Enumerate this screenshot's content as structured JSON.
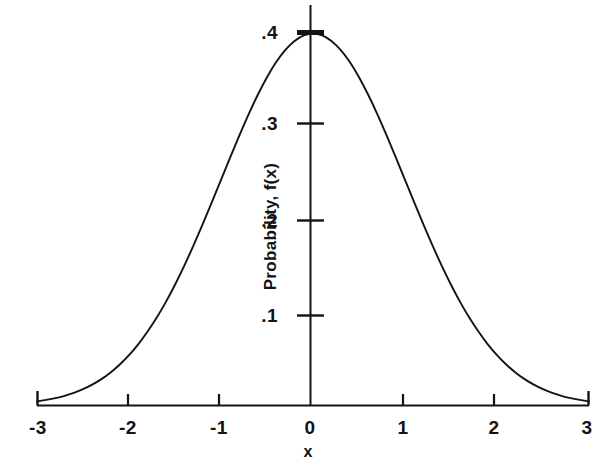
{
  "figure": {
    "background_color": "#ffffff",
    "ink_color": "#131313"
  },
  "chart_data": {
    "type": "line",
    "title": "",
    "subtitle": "",
    "xlabel": "x",
    "ylabel": "Probability, f(x)",
    "xlim": [
      -3,
      3
    ],
    "ylim": [
      0,
      0.4
    ],
    "grid": false,
    "legend": null,
    "annotations": [],
    "x_ticks": [
      -3,
      -2,
      -1,
      0,
      1,
      2,
      3
    ],
    "x_tick_labels": [
      "-3",
      "-2",
      "-1",
      "0",
      "1",
      "2",
      "3"
    ],
    "y_ticks": [
      0.1,
      0.2,
      0.3,
      0.4
    ],
    "y_tick_labels": [
      ".1",
      ".2",
      ".3",
      ".4"
    ],
    "series": [
      {
        "name": "standard normal probability density",
        "x": [
          -3.0,
          -2.9,
          -2.8,
          -2.7,
          -2.6,
          -2.5,
          -2.4,
          -2.3,
          -2.2,
          -2.1,
          -2.0,
          -1.9,
          -1.8,
          -1.7,
          -1.6,
          -1.5,
          -1.4,
          -1.3,
          -1.2,
          -1.1,
          -1.0,
          -0.9,
          -0.8,
          -0.7,
          -0.6,
          -0.5,
          -0.4,
          -0.3,
          -0.2,
          -0.1,
          0.0,
          0.1,
          0.2,
          0.3,
          0.4,
          0.5,
          0.6,
          0.7,
          0.8,
          0.9,
          1.0,
          1.1,
          1.2,
          1.3,
          1.4,
          1.5,
          1.6,
          1.7,
          1.8,
          1.9,
          2.0,
          2.1,
          2.2,
          2.3,
          2.4,
          2.5,
          2.6,
          2.7,
          2.8,
          2.9,
          3.0
        ],
        "values": [
          0.0044,
          0.006,
          0.0079,
          0.0104,
          0.0136,
          0.0175,
          0.0224,
          0.0283,
          0.0355,
          0.044,
          0.054,
          0.0656,
          0.079,
          0.094,
          0.1109,
          0.1295,
          0.1497,
          0.1714,
          0.1942,
          0.2179,
          0.242,
          0.2661,
          0.2897,
          0.3123,
          0.3332,
          0.3521,
          0.3683,
          0.3814,
          0.391,
          0.397,
          0.3989,
          0.397,
          0.391,
          0.3814,
          0.3683,
          0.3521,
          0.3332,
          0.3123,
          0.2897,
          0.2661,
          0.242,
          0.2179,
          0.1942,
          0.1714,
          0.1497,
          0.1295,
          0.1109,
          0.094,
          0.079,
          0.0656,
          0.054,
          0.044,
          0.0355,
          0.0283,
          0.0224,
          0.0175,
          0.0136,
          0.0104,
          0.0079,
          0.006,
          0.0044
        ]
      }
    ]
  },
  "labels": {
    "y_tick_4": ".4",
    "y_tick_3": ".3",
    "y_tick_2": ".2",
    "y_tick_1": ".1",
    "x_tick_m3": "-3",
    "x_tick_m2": "-2",
    "x_tick_m1": "-1",
    "x_tick_0": "0",
    "x_tick_p1": "1",
    "x_tick_p2": "2",
    "x_tick_p3": "3",
    "axis_x": "x",
    "axis_y": "Probability, f(x)"
  }
}
